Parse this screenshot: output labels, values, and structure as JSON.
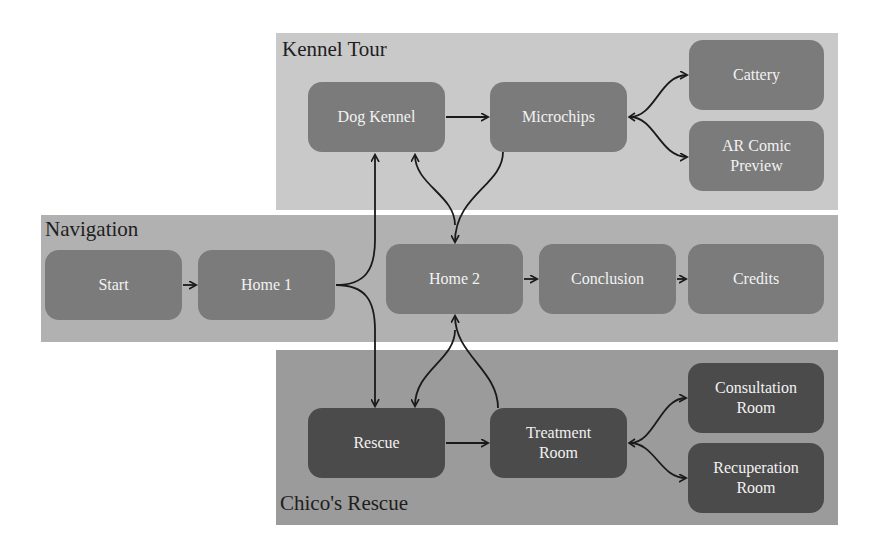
{
  "groups": {
    "kennel_tour": {
      "title": "Kennel Tour",
      "color": "#c9c9c9"
    },
    "navigation": {
      "title": "Navigation",
      "color": "#b1b1b1"
    },
    "chicos_rescue": {
      "title": "Chico's Rescue",
      "color": "#9b9b9b"
    }
  },
  "nodes": {
    "dog_kennel": "Dog Kennel",
    "microchips": "Microchips",
    "cattery": "Cattery",
    "ar_comic_preview": "AR Comic\nPreview",
    "start": "Start",
    "home1": "Home 1",
    "home2": "Home 2",
    "conclusion": "Conclusion",
    "credits": "Credits",
    "rescue": "Rescue",
    "treatment_room": "Treatment\nRoom",
    "consultation_room": "Consultation\nRoom",
    "recuperation_room": "Recuperation\nRoom"
  },
  "edges": [
    {
      "from": "Start",
      "to": "Home 1"
    },
    {
      "from": "Home 1",
      "to": "Dog Kennel"
    },
    {
      "from": "Home 1",
      "to": "Rescue"
    },
    {
      "from": "Dog Kennel",
      "to": "Microchips"
    },
    {
      "from": "Microchips",
      "to": "Home 2"
    },
    {
      "from": "Home 2",
      "to": "Dog Kennel"
    },
    {
      "from": "Microchips",
      "to": "Cattery"
    },
    {
      "from": "Microchips",
      "to": "AR Comic Preview"
    },
    {
      "from": "Home 2",
      "to": "Conclusion"
    },
    {
      "from": "Conclusion",
      "to": "Credits"
    },
    {
      "from": "Rescue",
      "to": "Treatment Room"
    },
    {
      "from": "Treatment Room",
      "to": "Home 2"
    },
    {
      "from": "Home 2",
      "to": "Rescue"
    },
    {
      "from": "Treatment Room",
      "to": "Consultation Room"
    },
    {
      "from": "Treatment Room",
      "to": "Recuperation Room"
    }
  ]
}
